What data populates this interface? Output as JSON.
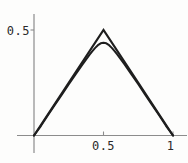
{
  "chart_data": {
    "type": "line",
    "title": "",
    "xlabel": "",
    "ylabel": "",
    "xlim": [
      0,
      1.1
    ],
    "ylim": [
      0,
      0.57
    ],
    "grid": false,
    "legend": "none",
    "x_ticks": [
      {
        "value": 0.5,
        "label": "0.5"
      },
      {
        "value": 1,
        "label": "1"
      }
    ],
    "y_ticks": [
      {
        "value": 0.5,
        "label": "0.5"
      }
    ],
    "series": [
      {
        "name": "tent-function",
        "style": "piecewise-linear",
        "points": [
          [
            0,
            0
          ],
          [
            0.5,
            0.5
          ],
          [
            1,
            0
          ]
        ]
      },
      {
        "name": "smooth-approximation",
        "style": "smooth",
        "formula_estimate": "y = 0.5 - sqrt((x-0.5)^2 + 0.06^2)",
        "peak": [
          0.5,
          0.44
        ],
        "points": [
          [
            0,
            0
          ],
          [
            0.05,
            0.046
          ],
          [
            0.1,
            0.096
          ],
          [
            0.15,
            0.145
          ],
          [
            0.2,
            0.194
          ],
          [
            0.25,
            0.243
          ],
          [
            0.3,
            0.291
          ],
          [
            0.35,
            0.338
          ],
          [
            0.4,
            0.383
          ],
          [
            0.42,
            0.4
          ],
          [
            0.44,
            0.415
          ],
          [
            0.46,
            0.428
          ],
          [
            0.48,
            0.437
          ],
          [
            0.5,
            0.44
          ],
          [
            0.52,
            0.437
          ],
          [
            0.54,
            0.428
          ],
          [
            0.56,
            0.415
          ],
          [
            0.58,
            0.4
          ],
          [
            0.6,
            0.383
          ],
          [
            0.65,
            0.338
          ],
          [
            0.7,
            0.291
          ],
          [
            0.75,
            0.243
          ],
          [
            0.8,
            0.194
          ],
          [
            0.85,
            0.145
          ],
          [
            0.9,
            0.096
          ],
          [
            0.95,
            0.046
          ],
          [
            1,
            0
          ]
        ]
      }
    ],
    "colors": {
      "line": "#1e1e1e",
      "axis": "#8c8c8c",
      "label": "#2a2a2a",
      "background": "#fdfdfc"
    }
  }
}
